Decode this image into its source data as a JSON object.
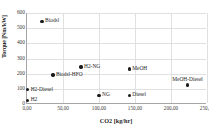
{
  "chart_data": {
    "type": "scatter",
    "title": "",
    "xlabel": "CO2  [kg/hr]",
    "ylabel": "Torque [Nm/kW]",
    "xlim": [
      0,
      250
    ],
    "ylim": [
      0,
      600
    ],
    "grid": true,
    "legend": "none",
    "xticks": [
      "0,00",
      "50,00",
      "100,00",
      "150,00",
      "200,00",
      "250,00"
    ],
    "xtick_values": [
      0,
      50,
      100,
      150,
      200,
      250
    ],
    "yticks": [
      "0",
      "100",
      "200",
      "300",
      "400",
      "500",
      "600"
    ],
    "ytick_values": [
      0,
      100,
      200,
      300,
      400,
      500,
      600
    ],
    "points": [
      {
        "label": "Biodsl",
        "x": 21,
        "y": 545,
        "label_pos": "right"
      },
      {
        "label": "H2-NG",
        "x": 75,
        "y": 245,
        "label_pos": "right"
      },
      {
        "label": "MeOH",
        "x": 142,
        "y": 232,
        "label_pos": "right"
      },
      {
        "label": "Biodsl-HFO",
        "x": 36,
        "y": 190,
        "label_pos": "right"
      },
      {
        "label": "MeOH-Diesel",
        "x": 223,
        "y": 126,
        "label_pos": "above"
      },
      {
        "label": "H2-Diesel",
        "x": 1,
        "y": 95,
        "label_pos": "right"
      },
      {
        "label": "NG",
        "x": 100,
        "y": 57,
        "label_pos": "right"
      },
      {
        "label": "Diesel",
        "x": 142,
        "y": 57,
        "label_pos": "right"
      },
      {
        "label": "H2",
        "x": 1,
        "y": 25,
        "label_pos": "right"
      }
    ],
    "series_name": "Fuel options",
    "marker_color": "#1a1a1a",
    "grid_color": "#e0e0e0",
    "axis_color": "#a6a6a6"
  }
}
